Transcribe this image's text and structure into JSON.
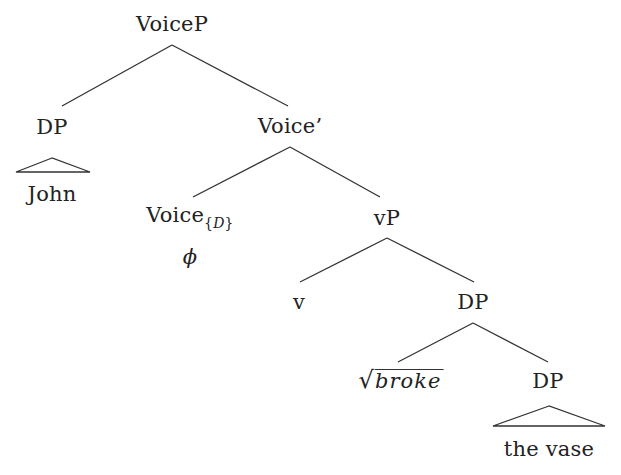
{
  "diagram": {
    "type": "syntax-tree",
    "colors": {
      "background": "#ffffff",
      "text": "#222222",
      "lines": "#333333"
    },
    "nodes": {
      "voicep": {
        "label": "VoiceP"
      },
      "dp_subject": {
        "label": "DP"
      },
      "john": {
        "label": "John"
      },
      "voice_bar": {
        "label": "Voice’"
      },
      "voice_head": {
        "label": "Voice",
        "subscript": "D",
        "subscript_open": "{",
        "subscript_close": "}"
      },
      "phi": {
        "label": "ϕ"
      },
      "vp": {
        "label": "vP"
      },
      "v": {
        "label": "v"
      },
      "dp_object": {
        "label": "DP"
      },
      "root": {
        "radical": "√",
        "label": "broke"
      },
      "dp_inner": {
        "label": "DP"
      },
      "the_vase": {
        "label": "the vase"
      }
    },
    "edges": [
      [
        "VoiceP",
        "DP"
      ],
      [
        "VoiceP",
        "Voice’"
      ],
      [
        "DP",
        "John (triangle)"
      ],
      [
        "Voice’",
        "Voice{D}"
      ],
      [
        "Voice’",
        "vP"
      ],
      [
        "vP",
        "v"
      ],
      [
        "vP",
        "DP"
      ],
      [
        "DP",
        "√broke"
      ],
      [
        "DP",
        "DP"
      ],
      [
        "DP",
        "the vase (triangle)"
      ]
    ]
  }
}
